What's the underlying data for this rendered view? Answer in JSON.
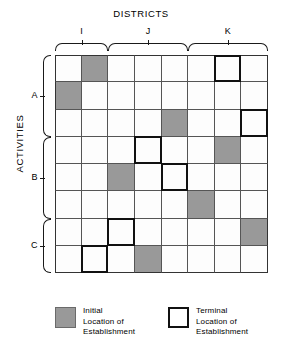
{
  "title": "DISTRICTS",
  "axis_y_title": "ACTIVITIES",
  "districts": [
    {
      "label": "I",
      "columns": [
        1,
        2
      ]
    },
    {
      "label": "J",
      "columns": [
        3,
        4,
        5
      ]
    },
    {
      "label": "K",
      "columns": [
        6,
        7,
        8
      ]
    }
  ],
  "activities": [
    {
      "label": "A",
      "rows": [
        1,
        2,
        3
      ]
    },
    {
      "label": "B",
      "rows": [
        4,
        5,
        6
      ]
    },
    {
      "label": "C",
      "rows": [
        7,
        8
      ]
    }
  ],
  "grid": {
    "rows": 8,
    "columns": 8,
    "initial_color": "#999999",
    "terminal_border_color": "#111111",
    "line_color": "#555555",
    "cells": [
      {
        "row": 1,
        "col": 2,
        "state": "initial"
      },
      {
        "row": 1,
        "col": 7,
        "state": "terminal"
      },
      {
        "row": 2,
        "col": 1,
        "state": "initial"
      },
      {
        "row": 3,
        "col": 5,
        "state": "initial"
      },
      {
        "row": 3,
        "col": 8,
        "state": "terminal"
      },
      {
        "row": 4,
        "col": 4,
        "state": "terminal"
      },
      {
        "row": 4,
        "col": 7,
        "state": "initial"
      },
      {
        "row": 5,
        "col": 3,
        "state": "initial"
      },
      {
        "row": 5,
        "col": 5,
        "state": "terminal"
      },
      {
        "row": 6,
        "col": 6,
        "state": "initial"
      },
      {
        "row": 7,
        "col": 3,
        "state": "terminal"
      },
      {
        "row": 7,
        "col": 8,
        "state": "initial"
      },
      {
        "row": 8,
        "col": 2,
        "state": "terminal"
      },
      {
        "row": 8,
        "col": 4,
        "state": "initial"
      }
    ]
  },
  "legend": {
    "initial": {
      "line1": "Initial",
      "line2": "Location of",
      "line3": "Establishment"
    },
    "terminal": {
      "line1": "Terminal",
      "line2": "Location of",
      "line3": "Establishment"
    }
  },
  "chart_data": {
    "type": "heatmap",
    "title": "DISTRICTS",
    "xlabel": "DISTRICTS",
    "ylabel": "ACTIVITIES",
    "x_groups": [
      "I",
      "J",
      "K"
    ],
    "y_groups": [
      "A",
      "B",
      "C"
    ],
    "x_group_spans": [
      2,
      3,
      3
    ],
    "y_group_spans": [
      3,
      3,
      2
    ],
    "rows": 8,
    "columns": 8,
    "grid": true,
    "legend": [
      "Initial Location of Establishment",
      "Terminal Location of Establishment"
    ],
    "marks": [
      {
        "row": 1,
        "col": 2,
        "value": "initial"
      },
      {
        "row": 1,
        "col": 7,
        "value": "terminal"
      },
      {
        "row": 2,
        "col": 1,
        "value": "initial"
      },
      {
        "row": 3,
        "col": 5,
        "value": "initial"
      },
      {
        "row": 3,
        "col": 8,
        "value": "terminal"
      },
      {
        "row": 4,
        "col": 4,
        "value": "terminal"
      },
      {
        "row": 4,
        "col": 7,
        "value": "initial"
      },
      {
        "row": 5,
        "col": 3,
        "value": "initial"
      },
      {
        "row": 5,
        "col": 5,
        "value": "terminal"
      },
      {
        "row": 6,
        "col": 6,
        "value": "initial"
      },
      {
        "row": 7,
        "col": 3,
        "value": "terminal"
      },
      {
        "row": 7,
        "col": 8,
        "value": "initial"
      },
      {
        "row": 8,
        "col": 2,
        "value": "terminal"
      },
      {
        "row": 8,
        "col": 4,
        "value": "initial"
      }
    ]
  }
}
